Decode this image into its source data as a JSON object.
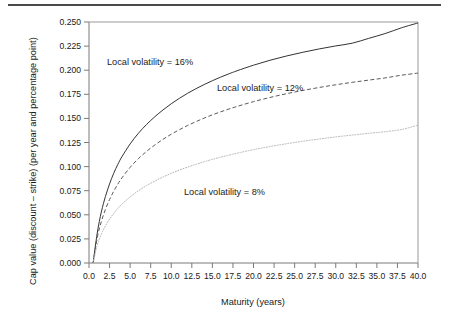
{
  "chart_data": {
    "type": "line",
    "title": "",
    "xlabel": "Maturity (years)",
    "ylabel": "Cap value (discount – strike) (per year and percentage point)",
    "xlim": [
      0.0,
      40.0
    ],
    "ylim": [
      0.0,
      0.25
    ],
    "grid": false,
    "legend_position": "inline-annotations",
    "xticks": [
      "0.0",
      "2.5",
      "5.0",
      "7.5",
      "10.0",
      "12.5",
      "15.0",
      "17.5",
      "20.0",
      "22.5",
      "25.0",
      "27.5",
      "30.0",
      "32.5",
      "35.0",
      "37.5",
      "40.0"
    ],
    "xtick_values": [
      0,
      2.5,
      5,
      7.5,
      10,
      12.5,
      15,
      17.5,
      20,
      22.5,
      25,
      27.5,
      30,
      32.5,
      35,
      37.5,
      40
    ],
    "yticks": [
      "0.000",
      "0.025",
      "0.050",
      "0.075",
      "0.100",
      "0.125",
      "0.150",
      "0.175",
      "0.200",
      "0.225",
      "0.250"
    ],
    "ytick_values": [
      0,
      0.025,
      0.05,
      0.075,
      0.1,
      0.125,
      0.15,
      0.175,
      0.2,
      0.225,
      0.25
    ],
    "x": [
      0.5,
      1,
      1.5,
      2,
      2.5,
      3,
      3.5,
      4,
      5,
      6,
      7,
      8,
      9,
      10,
      11,
      12,
      13,
      14,
      15,
      16,
      17,
      18,
      20,
      22,
      24,
      26,
      28,
      30,
      32,
      34,
      36,
      38,
      40
    ],
    "series": [
      {
        "name": "Local volatility = 16%",
        "style": "solid",
        "color": "#333333",
        "annotation": "Local volatility = 16%",
        "values": [
          0.0,
          0.031,
          0.053,
          0.069,
          0.082,
          0.093,
          0.1022,
          0.1102,
          0.1235,
          0.1345,
          0.1437,
          0.1517,
          0.1588,
          0.1652,
          0.1709,
          0.1761,
          0.1808,
          0.1851,
          0.1891,
          0.1928,
          0.1962,
          0.1994,
          0.2052,
          0.2103,
          0.2147,
          0.2186,
          0.2221,
          0.2252,
          0.228,
          0.233,
          0.238,
          0.244,
          0.249
        ]
      },
      {
        "name": "Local volatility = 12%",
        "style": "dashed",
        "color": "#5a5a5a",
        "annotation": "Local volatility = 12%",
        "values": [
          0.0,
          0.0262,
          0.043,
          0.0556,
          0.0658,
          0.0744,
          0.0818,
          0.0883,
          0.0992,
          0.1082,
          0.1158,
          0.1224,
          0.1283,
          0.1336,
          0.1383,
          0.1427,
          0.1466,
          0.1503,
          0.1537,
          0.1568,
          0.1597,
          0.1624,
          0.1674,
          0.1717,
          0.1756,
          0.179,
          0.1821,
          0.1849,
          0.1874,
          0.1897,
          0.192,
          0.1948,
          0.197
        ]
      },
      {
        "name": "Local volatility = 8%",
        "style": "dotted",
        "color": "#b5b5b5",
        "annotation": "Local volatility = 8%",
        "values": [
          0.0,
          0.0185,
          0.03,
          0.0385,
          0.0455,
          0.0514,
          0.0565,
          0.061,
          0.0686,
          0.0749,
          0.0803,
          0.085,
          0.0892,
          0.093,
          0.0964,
          0.0995,
          0.1023,
          0.105,
          0.1075,
          0.1098,
          0.1119,
          0.1139,
          0.1176,
          0.1208,
          0.1237,
          0.1263,
          0.1286,
          0.1308,
          0.1327,
          0.1345,
          0.1362,
          0.1385,
          0.143
        ]
      }
    ]
  },
  "annotations": {
    "vol16": "Local volatility = 16%",
    "vol12": "Local volatility = 12%",
    "vol8": "Local volatility = 8%"
  },
  "axes": {
    "x_title": "Maturity (years)",
    "y_title": "Cap value (discount – strike) (per year and percentage point)"
  }
}
